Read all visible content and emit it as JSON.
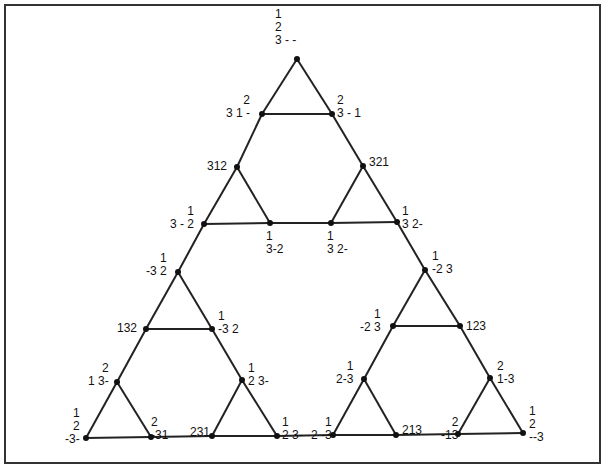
{
  "diagram": {
    "type": "sierpinski-graph",
    "line_color": "#222222",
    "node_color": "#111111",
    "nodes": [
      {
        "id": "n0",
        "x": 297,
        "y": 59,
        "label": "1\n2\n3 - -",
        "lx": 275,
        "ly": 8,
        "align": "left"
      },
      {
        "id": "n1",
        "x": 262,
        "y": 114,
        "label": "2\n3 1 -",
        "lx": 226,
        "ly": 94,
        "align": "right"
      },
      {
        "id": "n2",
        "x": 332,
        "y": 114,
        "label": "2\n3 - 1",
        "lx": 337,
        "ly": 94,
        "align": "left"
      },
      {
        "id": "n3",
        "x": 237,
        "y": 167,
        "label": "312",
        "lx": 207,
        "ly": 160,
        "align": "left"
      },
      {
        "id": "n4",
        "x": 363,
        "y": 166,
        "label": "321",
        "lx": 369,
        "ly": 156,
        "align": "left"
      },
      {
        "id": "n5",
        "x": 204,
        "y": 224,
        "label": "1\n3 - 2",
        "lx": 170,
        "ly": 205,
        "align": "right"
      },
      {
        "id": "n6",
        "x": 270,
        "y": 223,
        "label": "1\n3-2",
        "lx": 266,
        "ly": 230,
        "align": "left"
      },
      {
        "id": "n7",
        "x": 331,
        "y": 223,
        "label": "1\n3 2-",
        "lx": 327,
        "ly": 230,
        "align": "left"
      },
      {
        "id": "n8",
        "x": 397,
        "y": 222,
        "label": "1\n3 2-",
        "lx": 402,
        "ly": 205,
        "align": "left"
      },
      {
        "id": "n9",
        "x": 178,
        "y": 272,
        "label": "1\n-3 2",
        "lx": 146,
        "ly": 252,
        "align": "right"
      },
      {
        "id": "n10",
        "x": 425,
        "y": 270,
        "label": "1\n-2 3",
        "lx": 432,
        "ly": 250,
        "align": "left"
      },
      {
        "id": "n11",
        "x": 146,
        "y": 329,
        "label": "132",
        "lx": 117,
        "ly": 322,
        "align": "left"
      },
      {
        "id": "n12",
        "x": 212,
        "y": 329,
        "label": "1\n-3 2",
        "lx": 218,
        "ly": 310,
        "align": "left"
      },
      {
        "id": "n13",
        "x": 393,
        "y": 326,
        "label": "1\n-2 3",
        "lx": 360,
        "ly": 308,
        "align": "right"
      },
      {
        "id": "n14",
        "x": 460,
        "y": 326,
        "label": "123",
        "lx": 466,
        "ly": 320,
        "align": "left"
      },
      {
        "id": "n15",
        "x": 117,
        "y": 382,
        "label": "2\n1 3-",
        "lx": 88,
        "ly": 362,
        "align": "right"
      },
      {
        "id": "n16",
        "x": 242,
        "y": 380,
        "label": "1\n2 3-",
        "lx": 248,
        "ly": 362,
        "align": "left"
      },
      {
        "id": "n17",
        "x": 364,
        "y": 379,
        "label": "1\n2-3",
        "lx": 336,
        "ly": 360,
        "align": "right"
      },
      {
        "id": "n18",
        "x": 490,
        "y": 378,
        "label": "2\n1-3",
        "lx": 497,
        "ly": 360,
        "align": "left"
      },
      {
        "id": "n19",
        "x": 86,
        "y": 438,
        "label": "1\n2\n-3-",
        "lx": 65,
        "ly": 407,
        "align": "right"
      },
      {
        "id": "n20",
        "x": 151,
        "y": 437,
        "label": "2\n-31",
        "lx": 151,
        "ly": 416,
        "align": "left"
      },
      {
        "id": "n21",
        "x": 212,
        "y": 436,
        "label": "231",
        "lx": 190,
        "ly": 426,
        "align": "left"
      },
      {
        "id": "n22",
        "x": 277,
        "y": 436,
        "label": "1\n2 3-",
        "lx": 282,
        "ly": 416,
        "align": "left"
      },
      {
        "id": "n23",
        "x": 333,
        "y": 435,
        "label": "1\n2 -3",
        "lx": 311,
        "ly": 416,
        "align": "right"
      },
      {
        "id": "n24",
        "x": 396,
        "y": 435,
        "label": "213",
        "lx": 402,
        "ly": 424,
        "align": "left"
      },
      {
        "id": "n25",
        "x": 458,
        "y": 434,
        "label": "2\n-13",
        "lx": 441,
        "ly": 416,
        "align": "right"
      },
      {
        "id": "n26",
        "x": 523,
        "y": 433,
        "label": "1\n2\n--3",
        "lx": 529,
        "ly": 405,
        "align": "left"
      }
    ],
    "edges": [
      [
        "n0",
        "n1"
      ],
      [
        "n0",
        "n2"
      ],
      [
        "n1",
        "n2"
      ],
      [
        "n1",
        "n3"
      ],
      [
        "n2",
        "n4"
      ],
      [
        "n3",
        "n5"
      ],
      [
        "n3",
        "n6"
      ],
      [
        "n5",
        "n6"
      ],
      [
        "n4",
        "n7"
      ],
      [
        "n4",
        "n8"
      ],
      [
        "n7",
        "n8"
      ],
      [
        "n6",
        "n7"
      ],
      [
        "n5",
        "n9"
      ],
      [
        "n8",
        "n10"
      ],
      [
        "n9",
        "n11"
      ],
      [
        "n9",
        "n12"
      ],
      [
        "n11",
        "n12"
      ],
      [
        "n10",
        "n13"
      ],
      [
        "n10",
        "n14"
      ],
      [
        "n13",
        "n14"
      ],
      [
        "n11",
        "n15"
      ],
      [
        "n12",
        "n16"
      ],
      [
        "n13",
        "n17"
      ],
      [
        "n14",
        "n18"
      ],
      [
        "n15",
        "n19"
      ],
      [
        "n15",
        "n20"
      ],
      [
        "n19",
        "n20"
      ],
      [
        "n16",
        "n21"
      ],
      [
        "n16",
        "n22"
      ],
      [
        "n21",
        "n22"
      ],
      [
        "n17",
        "n23"
      ],
      [
        "n17",
        "n24"
      ],
      [
        "n23",
        "n24"
      ],
      [
        "n18",
        "n25"
      ],
      [
        "n18",
        "n26"
      ],
      [
        "n25",
        "n26"
      ],
      [
        "n20",
        "n21"
      ],
      [
        "n22",
        "n23"
      ],
      [
        "n24",
        "n25"
      ]
    ]
  }
}
